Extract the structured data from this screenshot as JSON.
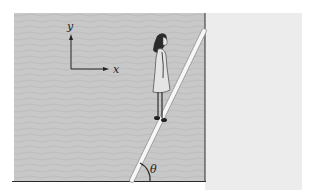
{
  "figure": {
    "axes": {
      "x_label": "x",
      "y_label": "y"
    },
    "angle_label": "θ",
    "colors": {
      "wall_fill": "#c9c9c9",
      "right_region": "#ececec",
      "plank": "#f6f6f6",
      "lines": "#2a2a2a"
    }
  }
}
